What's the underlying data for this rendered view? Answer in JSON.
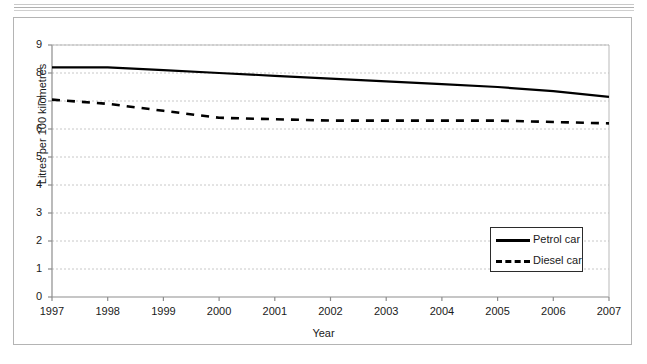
{
  "figure": {
    "frame_color": "#b4b4b4",
    "background": "#ffffff"
  },
  "chart_data": {
    "type": "line",
    "title": "",
    "xlabel": "Year",
    "ylabel": "Litres per 100 kilometres",
    "x": [
      1997,
      1998,
      1999,
      2000,
      2001,
      2002,
      2003,
      2004,
      2005,
      2006,
      2007
    ],
    "categories": [
      "1997",
      "1998",
      "1999",
      "2000",
      "2001",
      "2002",
      "2003",
      "2004",
      "2005",
      "2006",
      "2007"
    ],
    "xlim": [
      1997,
      2007
    ],
    "ylim": [
      0,
      9
    ],
    "yticks": [
      0,
      1,
      2,
      3,
      4,
      5,
      6,
      7,
      8,
      9
    ],
    "ytick_labels": [
      "0",
      "1",
      "2",
      "3",
      "4",
      "5",
      "6",
      "7",
      "8",
      "9"
    ],
    "xtick_labels": [
      "1997",
      "1998",
      "1999",
      "2000",
      "2001",
      "2002",
      "2003",
      "2004",
      "2005",
      "2006",
      "2007"
    ],
    "grid": true,
    "grid_style": "dotted",
    "grid_color": "#c8c8c8",
    "legend_position": "center-right",
    "series": [
      {
        "name": "Petrol car",
        "style": "solid",
        "color": "#000000",
        "width": 2.2,
        "values": [
          8.2,
          8.2,
          8.1,
          8.0,
          7.9,
          7.8,
          7.7,
          7.6,
          7.5,
          7.35,
          7.15
        ]
      },
      {
        "name": "Diesel car",
        "style": "dashed",
        "color": "#000000",
        "width": 2.6,
        "values": [
          7.05,
          6.9,
          6.65,
          6.4,
          6.35,
          6.3,
          6.3,
          6.3,
          6.3,
          6.25,
          6.2
        ]
      }
    ]
  },
  "legend": {
    "items": [
      {
        "label": "Petrol car",
        "style": "solid"
      },
      {
        "label": "Diesel car",
        "style": "dashed"
      }
    ]
  }
}
